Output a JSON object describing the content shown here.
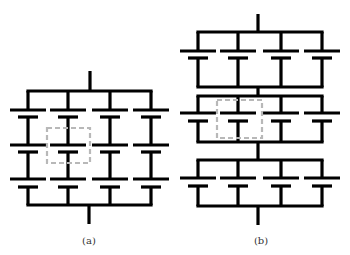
{
  "colors": {
    "wire": "#000000",
    "highlight": "#b8b8b8",
    "background": "#ffffff"
  },
  "subfigures": [
    {
      "id": "a",
      "label": "(a)",
      "label_pos": [
        89,
        235
      ],
      "description": "4x3 capacitor grid with shared rails between rows",
      "columns": [
        28,
        68,
        110,
        151
      ],
      "top_stem": [
        90,
        71,
        91
      ],
      "bottom_stem": [
        89,
        205,
        224
      ],
      "buses": [
        91,
        205
      ],
      "rows": [
        {
          "long_y": 110,
          "short_y": 117
        },
        {
          "long_y": 145,
          "short_y": 152
        },
        {
          "long_y": 179,
          "short_y": 187
        }
      ],
      "highlight_box": [
        47,
        128,
        43,
        35
      ]
    },
    {
      "id": "b",
      "label": "(b)",
      "label_pos": [
        261,
        235
      ],
      "description": "three series-connected blocks of four parallel capacitors",
      "columns": [
        198,
        238,
        281,
        322
      ],
      "top_stem": [
        258,
        14,
        32
      ],
      "bottom_stem": [
        258,
        206,
        225
      ],
      "blocks": [
        {
          "top_bus": 32,
          "long_y": 51,
          "short_y": 58,
          "bottom_bus": 87
        },
        {
          "top_bus": 96,
          "long_y": 113,
          "short_y": 121,
          "bottom_bus": 142
        },
        {
          "top_bus": 160,
          "long_y": 178,
          "short_y": 186,
          "bottom_bus": 206
        }
      ],
      "highlight_box": [
        217,
        100,
        45,
        38
      ]
    }
  ],
  "plate": {
    "long_half": 18,
    "short_half": 10
  }
}
